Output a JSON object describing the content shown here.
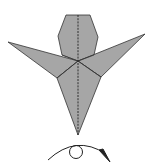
{
  "diagram": {
    "type": "origami-fold-step",
    "model_fill": "#a6a6a6",
    "line_color": "#222222",
    "background": "#ffffff",
    "symbols": {
      "model": "folded-model-bird-shape",
      "centerline": "valley-fold-dashed-line",
      "action": "turn-over-symbol"
    }
  }
}
